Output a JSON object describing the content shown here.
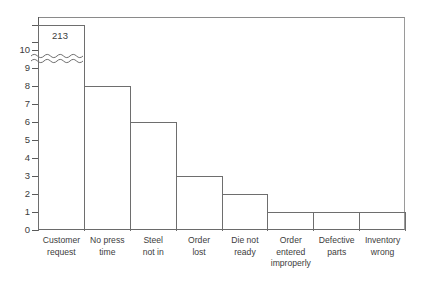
{
  "chart_data": {
    "type": "bar",
    "title": "",
    "subtitle": "",
    "xlabel": "",
    "ylabel": "",
    "ylim": [
      0,
      11
    ],
    "grid": false,
    "legend": null,
    "axis_break": {
      "present": true,
      "style": "wavy",
      "below_value": 11,
      "note": "y-axis broken just above 10; first bar truncated"
    },
    "categories": [
      "Customer request",
      "No press time",
      "Steel not in",
      "Order lost",
      "Die not ready",
      "Order entered improperly",
      "Defective parts",
      "Inventory wrong"
    ],
    "category_lines": [
      [
        "Customer",
        "request"
      ],
      [
        "No press",
        "time"
      ],
      [
        "Steel",
        "not in"
      ],
      [
        "Order",
        "lost"
      ],
      [
        "Die not",
        "ready"
      ],
      [
        "Order",
        "entered",
        "improperly"
      ],
      [
        "Defective",
        "parts"
      ],
      [
        "Inventory",
        "wrong"
      ]
    ],
    "values": [
      213,
      8,
      6,
      3,
      2,
      1,
      1,
      1
    ],
    "data_labels": [
      "213",
      "",
      "",
      "",
      "",
      "",
      "",
      ""
    ],
    "yticks": [
      0,
      1,
      2,
      3,
      4,
      5,
      6,
      7,
      8,
      9,
      10
    ],
    "ytick_labels": [
      "0",
      "1",
      "2",
      "3",
      "4",
      "5",
      "6",
      "7",
      "8",
      "9",
      "10"
    ],
    "colors": {
      "bar_outline": "#6e6e6e",
      "bar_fill": "#ffffff",
      "axis": "#5a5a5a",
      "frame": "#8a8a8a",
      "text": "#3c3c3c",
      "background": "#ffffff"
    }
  }
}
